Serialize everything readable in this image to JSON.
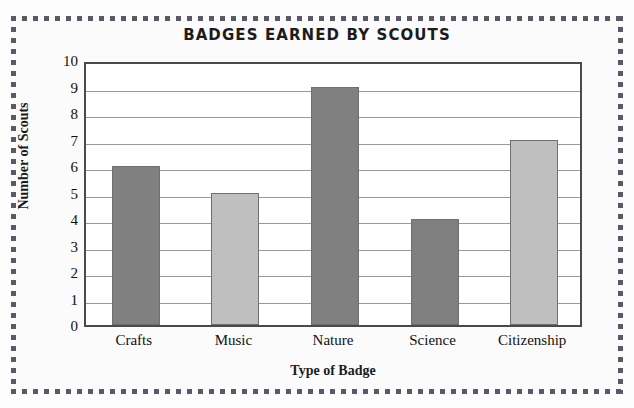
{
  "chart_data": {
    "type": "bar",
    "title": "BADGES EARNED BY SCOUTS",
    "xlabel": "Type of Badge",
    "ylabel": "Number of Scouts",
    "categories": [
      "Crafts",
      "Music",
      "Nature",
      "Science",
      "Citizenship"
    ],
    "values": [
      6,
      5,
      9,
      4,
      7
    ],
    "bar_colors": [
      "#808080",
      "#bfbfbf",
      "#808080",
      "#808080",
      "#bfbfbf"
    ],
    "ylim": [
      0,
      10
    ],
    "ytick_labels": [
      "10",
      "9",
      "8",
      "7",
      "6",
      "5",
      "4",
      "3",
      "2",
      "1",
      "0"
    ],
    "ytick_values": [
      10,
      9,
      8,
      7,
      6,
      5,
      4,
      3,
      2,
      1,
      0
    ],
    "grid": true,
    "legend": "none",
    "series": [
      {
        "name": "Number of Scouts",
        "values": [
          6,
          5,
          9,
          4,
          7
        ]
      }
    ],
    "points": [
      {
        "category": "Crafts",
        "value": 6,
        "color": "#808080"
      },
      {
        "category": "Music",
        "value": 5,
        "color": "#bfbfbf"
      },
      {
        "category": "Nature",
        "value": 9,
        "color": "#808080"
      },
      {
        "category": "Science",
        "value": 4,
        "color": "#808080"
      },
      {
        "category": "Citizenship",
        "value": 7,
        "color": "#bfbfbf"
      }
    ]
  },
  "style": {
    "page_background": "#fdfdfd",
    "panel_background": "#fbfbfb",
    "frame_dot_color": "#5a5a66",
    "plot_border_color": "#4a4a4a",
    "gridline_color": "#9a9a9a",
    "bar_border_color": "#6f6f6f",
    "text_color": "#111111"
  }
}
